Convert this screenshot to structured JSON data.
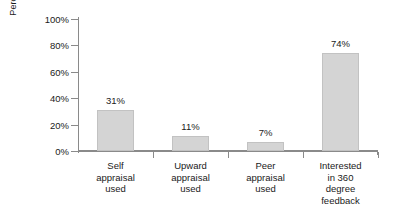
{
  "chart_data": {
    "type": "bar",
    "title": "",
    "subtitle": "",
    "xlabel": "",
    "ylabel": "Percentage use/interest",
    "ylim": [
      0,
      100
    ],
    "yticks": [
      0,
      20,
      40,
      60,
      80,
      100
    ],
    "ytick_labels": [
      "0%",
      "20%",
      "40%",
      "60%",
      "80%",
      "100%"
    ],
    "grid": false,
    "legend": false,
    "legend_position": "none",
    "orientation": "vertical",
    "bar_color": "#d4d4d4",
    "bar_border_color": "#c2c2c2",
    "axis_color": "#8a8a8a",
    "background_color": "#ffffff",
    "categories": [
      "Self appraisal used",
      "Upward appraisal used",
      "Peer appraisal used",
      "Interested in 360 degree feedback"
    ],
    "category_label_lines": [
      [
        "Self",
        "appraisal",
        "used"
      ],
      [
        "Upward",
        "appraisal",
        "used"
      ],
      [
        "Peer",
        "appraisal",
        "used"
      ],
      [
        "Interested",
        "in 360",
        "degree",
        "feedback"
      ]
    ],
    "values": [
      31,
      11,
      7,
      74
    ],
    "data_labels": [
      "31%",
      "11%",
      "7%",
      "74%"
    ],
    "series": [
      {
        "name": "Percentage use/interest",
        "values": [
          31,
          11,
          7,
          74
        ]
      }
    ]
  }
}
